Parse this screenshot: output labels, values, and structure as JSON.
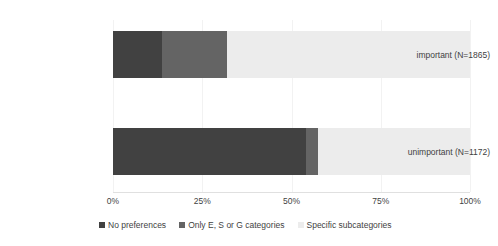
{
  "chart_data": {
    "type": "bar",
    "orientation": "horizontal",
    "stacked": true,
    "stack_mode": "percent",
    "title": "",
    "xlabel": "",
    "ylabel": "",
    "xlim": [
      0,
      100
    ],
    "grid": true,
    "legend_position": "bottom",
    "categories": [
      "important (N=1865)",
      "unimportant (N=1172)"
    ],
    "xtick_labels": [
      "0%",
      "25%",
      "50%",
      "75%",
      "100%"
    ],
    "xtick_values": [
      0,
      25,
      50,
      75,
      100
    ],
    "series": [
      {
        "name": "No preferences",
        "color": "#414141",
        "values": [
          13.7,
          54.0
        ]
      },
      {
        "name": "Only E, S or G categories",
        "color": "#646464",
        "values": [
          18.3,
          3.5
        ]
      },
      {
        "name": "Specific subcategories",
        "color": "#ececec",
        "values": [
          68.0,
          42.5
        ]
      }
    ]
  }
}
